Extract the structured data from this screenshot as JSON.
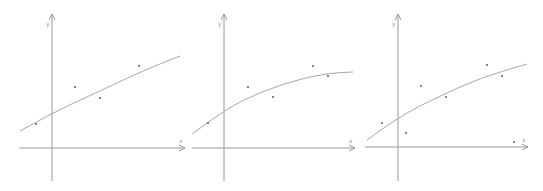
{
  "chart_data": [
    {
      "type": "scatter",
      "title": "",
      "xlabel": "x",
      "ylabel": "y",
      "grid": false,
      "description": "Scatter points with a fitted curve (linear-ish increasing)",
      "origin_px": [
        52,
        148
      ],
      "axis_px": {
        "x_from": 19,
        "x_to": 185,
        "y_from": 181,
        "y_to": 14
      },
      "points_px": [
        [
          36,
          124
        ],
        [
          75,
          87
        ],
        [
          100,
          98
        ],
        [
          139,
          66
        ]
      ],
      "curve_px": [
        [
          20,
          131
        ],
        [
          52,
          113
        ],
        [
          100,
          91
        ],
        [
          140,
          72
        ],
        [
          180,
          56
        ]
      ]
    },
    {
      "type": "scatter",
      "title": "",
      "xlabel": "x",
      "ylabel": "y",
      "grid": false,
      "description": "Scatter points with a fitted concave curve (quadratic fit)",
      "origin_px": [
        224,
        148
      ],
      "axis_px": {
        "x_from": 192,
        "x_to": 355,
        "y_from": 181,
        "y_to": 14
      },
      "points_px": [
        [
          208,
          123
        ],
        [
          248,
          87
        ],
        [
          273,
          97
        ],
        [
          313,
          66
        ],
        [
          328,
          76
        ]
      ],
      "curve_px": [
        [
          192,
          134
        ],
        [
          224,
          110
        ],
        [
          260,
          92
        ],
        [
          300,
          79
        ],
        [
          330,
          73
        ],
        [
          353,
          72
        ]
      ]
    },
    {
      "type": "scatter",
      "title": "",
      "xlabel": "x",
      "ylabel": "y",
      "grid": false,
      "description": "Scatter points with a fitted concave curve",
      "origin_px": [
        398,
        147
      ],
      "axis_px": {
        "x_from": 365,
        "x_to": 528,
        "y_from": 181,
        "y_to": 14
      },
      "points_px": [
        [
          382,
          123
        ],
        [
          406,
          133
        ],
        [
          421,
          86
        ],
        [
          446,
          97
        ],
        [
          487,
          65
        ],
        [
          502,
          76
        ],
        [
          514,
          142
        ]
      ],
      "curve_px": [
        [
          367,
          140
        ],
        [
          398,
          117
        ],
        [
          440,
          96
        ],
        [
          480,
          78
        ],
        [
          527,
          64
        ]
      ]
    }
  ],
  "labels": {
    "x": "x",
    "y": "y"
  }
}
